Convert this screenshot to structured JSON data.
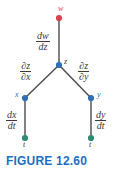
{
  "figure": {
    "caption": "FIGURE 12.60",
    "caption_color": "#1b6fc4",
    "width": 117,
    "height": 172
  },
  "colors": {
    "node_w": "#d9434c",
    "node_z": "#2f6fb5",
    "node_x": "#2f6fb5",
    "node_y": "#2f6fb5",
    "node_t_left": "#2e8b74",
    "node_t_right": "#2e8b74",
    "edge": "#4a4a4a",
    "label_math": "#3a3a3a",
    "label_blue": "#2f6fb5",
    "label_red": "#d9434c"
  },
  "nodes": [
    {
      "id": "w",
      "label": "w",
      "x": 59,
      "y": 18,
      "color": "#d9434c",
      "label_x": 58,
      "label_y": 5,
      "label_class": "node-label-w"
    },
    {
      "id": "z",
      "label": "z",
      "x": 59,
      "y": 65,
      "color": "#2f6fb5",
      "label_x": 64,
      "label_y": 58,
      "label_class": "node-label-z"
    },
    {
      "id": "x",
      "label": "x",
      "x": 25,
      "y": 98,
      "color": "#2f6fb5",
      "label_x": 15,
      "label_y": 91,
      "label_class": "node-label-xy"
    },
    {
      "id": "y",
      "label": "y",
      "x": 91,
      "y": 98,
      "color": "#2f6fb5",
      "label_x": 97,
      "label_y": 91,
      "label_class": "node-label-xy"
    },
    {
      "id": "t-left",
      "label": "t",
      "x": 25,
      "y": 138,
      "color": "#2e8b74",
      "label_x": 23,
      "label_y": 141,
      "label_class": "node-label-t"
    },
    {
      "id": "t-right",
      "label": "t",
      "x": 91,
      "y": 138,
      "color": "#2e8b74",
      "label_x": 89,
      "label_y": 141,
      "label_class": "node-label-t"
    }
  ],
  "edges": [
    {
      "id": "w-z",
      "from": "w",
      "to": "z",
      "x1": 59,
      "y1": 18,
      "x2": 59,
      "y2": 65
    },
    {
      "id": "z-x",
      "from": "z",
      "to": "x",
      "x1": 59,
      "y1": 65,
      "x2": 25,
      "y2": 98
    },
    {
      "id": "z-y",
      "from": "z",
      "to": "y",
      "x1": 59,
      "y1": 65,
      "x2": 91,
      "y2": 98
    },
    {
      "id": "x-t",
      "from": "x",
      "to": "t-left",
      "x1": 25,
      "y1": 98,
      "x2": 25,
      "y2": 138
    },
    {
      "id": "y-t",
      "from": "y",
      "to": "t-right",
      "x1": 91,
      "y1": 98,
      "x2": 91,
      "y2": 138
    }
  ],
  "edge_labels": [
    {
      "id": "dw-dz",
      "numerator": "dw",
      "denominator": "dz",
      "x": 36,
      "y": 31,
      "font_size": 10
    },
    {
      "id": "dz-dx",
      "numerator": "∂z",
      "denominator": "∂x",
      "x": 20,
      "y": 61,
      "font_size": 10
    },
    {
      "id": "dz-dy",
      "numerator": "∂z",
      "denominator": "∂y",
      "x": 78,
      "y": 61,
      "font_size": 10
    },
    {
      "id": "dx-dt",
      "numerator": "dx",
      "denominator": "dt",
      "x": 6,
      "y": 110,
      "font_size": 10
    },
    {
      "id": "dy-dt",
      "numerator": "dy",
      "denominator": "dt",
      "x": 95,
      "y": 110,
      "font_size": 10
    }
  ]
}
